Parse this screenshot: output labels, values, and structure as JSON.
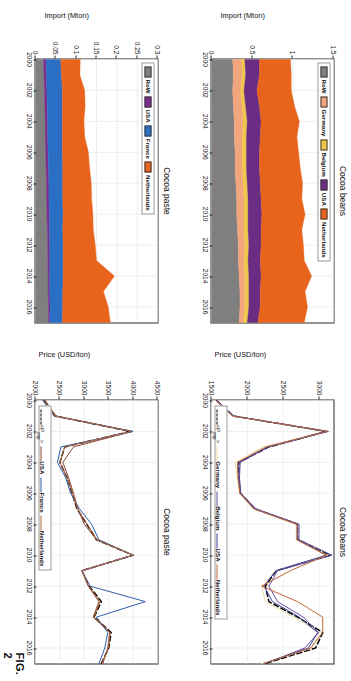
{
  "figure": {
    "label": "FIG. 2"
  },
  "panels": [
    {
      "id": "cocoa-beans-import",
      "title": "Cocoa beans",
      "ylabel": "Import (Mton)",
      "xticks": [
        "2000",
        "2002",
        "2004",
        "2006",
        "2008",
        "2010",
        "2012",
        "2014",
        "2016"
      ],
      "yticks": [
        "0",
        "0.5",
        "1",
        "1.5"
      ],
      "legend": [
        {
          "label": "RoW",
          "color": "#7f7f7f"
        },
        {
          "label": "Germany",
          "color": "#f2a67e"
        },
        {
          "label": "Belgium",
          "color": "#efc74b"
        },
        {
          "label": "USA",
          "color": "#6b2d84"
        },
        {
          "label": "Netherlands",
          "color": "#e8641c"
        }
      ]
    },
    {
      "id": "cocoa-beans-price",
      "title": "Cocoa beans",
      "ylabel": "Price (USD/ton)",
      "xticks": [
        "2000",
        "2002",
        "2004",
        "2006",
        "2008",
        "2010",
        "2012",
        "2014",
        "2016"
      ],
      "yticks": [
        "1500",
        "2000",
        "2500",
        "3000"
      ],
      "legend": [
        {
          "label": "<P_exp>",
          "color": "#000000",
          "style": "dashed"
        },
        {
          "label": "Germany",
          "color": "#edd9a3",
          "style": "solid"
        },
        {
          "label": "Belgium",
          "color": "#6b4fa0",
          "style": "solid"
        },
        {
          "label": "USA",
          "color": "#3b3f9e",
          "style": "solid"
        },
        {
          "label": "Netherlands",
          "color": "#c0663a",
          "style": "solid"
        }
      ]
    },
    {
      "id": "cocoa-paste-import",
      "title": "Cocoa paste",
      "ylabel": "Import (Mton)",
      "xticks": [
        "2000",
        "2002",
        "2004",
        "2006",
        "2008",
        "2010",
        "2012",
        "2014",
        "2016"
      ],
      "yticks": [
        "0",
        "0.05",
        "0.1",
        "0.15",
        "0.2",
        "0.25",
        "0.3"
      ],
      "legend": [
        {
          "label": "RoW",
          "color": "#7f7f7f"
        },
        {
          "label": "USA",
          "color": "#7b2b8e"
        },
        {
          "label": "France",
          "color": "#2b6fc4"
        },
        {
          "label": "Netherlands",
          "color": "#e8641c"
        }
      ]
    },
    {
      "id": "cocoa-paste-price",
      "title": "Cocoa paste",
      "ylabel": "Price (USD/ton)",
      "xticks": [
        "2000",
        "2002",
        "2004",
        "2006",
        "2008",
        "2010",
        "2012",
        "2014",
        "2016"
      ],
      "yticks": [
        "2000",
        "2500",
        "3000",
        "3500",
        "4000",
        "4500"
      ],
      "legend": [
        {
          "label": "<P_exp>",
          "color": "#000000",
          "style": "dashed"
        },
        {
          "label": "USA",
          "color": "#8a4a35",
          "style": "solid"
        },
        {
          "label": "France",
          "color": "#2f5fa8",
          "style": "solid"
        },
        {
          "label": "Netherlands",
          "color": "#b4663f",
          "style": "solid"
        }
      ]
    }
  ],
  "chart_data": [
    {
      "type": "area",
      "id": "cocoa-beans-import",
      "title": "Cocoa beans",
      "xlabel": "",
      "ylabel": "Import (Mton)",
      "xlim": [
        2000,
        2017
      ],
      "ylim": [
        0,
        1.5
      ],
      "grid": true,
      "legend_position": "top",
      "stacked": true,
      "x": [
        2000,
        2001,
        2002,
        2003,
        2004,
        2005,
        2006,
        2007,
        2008,
        2009,
        2010,
        2011,
        2012,
        2013,
        2014,
        2015,
        2016,
        2017
      ],
      "series": [
        {
          "name": "RoW",
          "color": "#7f7f7f",
          "values": [
            0.26,
            0.27,
            0.26,
            0.27,
            0.28,
            0.28,
            0.29,
            0.29,
            0.3,
            0.31,
            0.31,
            0.32,
            0.33,
            0.33,
            0.34,
            0.35,
            0.35,
            0.34
          ]
        },
        {
          "name": "Germany",
          "color": "#f2a67e",
          "values": [
            0.11,
            0.11,
            0.1,
            0.11,
            0.11,
            0.1,
            0.09,
            0.09,
            0.09,
            0.09,
            0.09,
            0.08,
            0.08,
            0.07,
            0.07,
            0.06,
            0.06,
            0.05
          ]
        },
        {
          "name": "Belgium",
          "color": "#efc74b",
          "values": [
            0.04,
            0.04,
            0.04,
            0.04,
            0.05,
            0.05,
            0.05,
            0.05,
            0.05,
            0.05,
            0.05,
            0.05,
            0.05,
            0.05,
            0.05,
            0.05,
            0.05,
            0.05
          ]
        },
        {
          "name": "USA",
          "color": "#6b2d84",
          "values": [
            0.18,
            0.17,
            0.16,
            0.17,
            0.17,
            0.17,
            0.16,
            0.16,
            0.16,
            0.16,
            0.17,
            0.16,
            0.15,
            0.15,
            0.15,
            0.14,
            0.14,
            0.13
          ]
        },
        {
          "name": "Netherlands",
          "color": "#e8641c",
          "values": [
            0.38,
            0.39,
            0.42,
            0.43,
            0.47,
            0.45,
            0.48,
            0.5,
            0.52,
            0.5,
            0.53,
            0.5,
            0.52,
            0.54,
            0.62,
            0.55,
            0.58,
            0.57
          ]
        }
      ],
      "xticks": [
        2000,
        2002,
        2004,
        2006,
        2008,
        2010,
        2012,
        2014,
        2016
      ],
      "yticks": [
        0,
        0.5,
        1,
        1.5
      ]
    },
    {
      "type": "line",
      "id": "cocoa-beans-price",
      "title": "Cocoa beans",
      "xlabel": "",
      "ylabel": "Price (USD/ton)",
      "xlim": [
        2000,
        2017
      ],
      "ylim": [
        1500,
        3200
      ],
      "grid": true,
      "legend_position": "bottom",
      "x": [
        2000,
        2001,
        2002,
        2003,
        2004,
        2005,
        2006,
        2007,
        2008,
        2009,
        2010,
        2011,
        2012,
        2013,
        2014,
        2015,
        2016,
        2017
      ],
      "series": [
        {
          "name": "<P_exp>",
          "color": "#000000",
          "style": "dashed",
          "values": [
            1570,
            1800,
            3100,
            2300,
            1880,
            1880,
            1900,
            2100,
            2700,
            2700,
            3150,
            2400,
            2250,
            2300,
            2700,
            3050,
            2950,
            2250
          ]
        },
        {
          "name": "Germany",
          "color": "#edd9a3",
          "style": "solid",
          "values": [
            1560,
            1790,
            3120,
            2220,
            1830,
            1860,
            1890,
            2080,
            2680,
            2680,
            3120,
            2390,
            2200,
            2250,
            2650,
            3000,
            2900,
            2200
          ]
        },
        {
          "name": "Belgium",
          "color": "#6b4fa0",
          "style": "solid",
          "values": [
            1580,
            1810,
            3130,
            2290,
            1900,
            1890,
            1910,
            2120,
            2720,
            2720,
            3180,
            2420,
            2300,
            2420,
            2780,
            2990,
            2800,
            2250
          ]
        },
        {
          "name": "USA",
          "color": "#3b3f9e",
          "style": "solid",
          "values": [
            1570,
            1800,
            3100,
            2280,
            1880,
            1880,
            1900,
            2100,
            2700,
            2700,
            3100,
            2400,
            2230,
            2350,
            2720,
            2980,
            2850,
            2230
          ]
        },
        {
          "name": "Netherlands",
          "color": "#c0663a",
          "style": "solid",
          "values": [
            1560,
            1795,
            3110,
            2260,
            1860,
            1870,
            1895,
            2090,
            2690,
            2690,
            3100,
            2600,
            2200,
            2700,
            3050,
            3050,
            2880,
            2230
          ]
        }
      ],
      "xticks": [
        2000,
        2002,
        2004,
        2006,
        2008,
        2010,
        2012,
        2014,
        2016
      ],
      "yticks": [
        1500,
        2000,
        2500,
        3000
      ]
    },
    {
      "type": "area",
      "id": "cocoa-paste-import",
      "title": "Cocoa paste",
      "xlabel": "",
      "ylabel": "Import (Mton)",
      "xlim": [
        2000,
        2017
      ],
      "ylim": [
        0,
        0.3
      ],
      "grid": true,
      "legend_position": "top",
      "stacked": true,
      "x": [
        2000,
        2001,
        2002,
        2003,
        2004,
        2005,
        2006,
        2007,
        2008,
        2009,
        2010,
        2011,
        2012,
        2013,
        2014,
        2015,
        2016,
        2017
      ],
      "series": [
        {
          "name": "RoW",
          "color": "#7f7f7f",
          "values": [
            0.02,
            0.021,
            0.022,
            0.023,
            0.024,
            0.024,
            0.025,
            0.026,
            0.027,
            0.027,
            0.028,
            0.029,
            0.03,
            0.03,
            0.031,
            0.031,
            0.032,
            0.032
          ]
        },
        {
          "name": "USA",
          "color": "#7b2b8e",
          "values": [
            0.006,
            0.006,
            0.006,
            0.006,
            0.006,
            0.006,
            0.006,
            0.006,
            0.006,
            0.006,
            0.006,
            0.005,
            0.005,
            0.005,
            0.004,
            0.004,
            0.004,
            0.003
          ]
        },
        {
          "name": "France",
          "color": "#2b6fc4",
          "values": [
            0.036,
            0.037,
            0.038,
            0.037,
            0.036,
            0.036,
            0.035,
            0.035,
            0.034,
            0.034,
            0.034,
            0.033,
            0.033,
            0.033,
            0.033,
            0.032,
            0.031,
            0.031
          ]
        },
        {
          "name": "Netherlands",
          "color": "#e8641c",
          "values": [
            0.048,
            0.045,
            0.055,
            0.056,
            0.053,
            0.055,
            0.064,
            0.066,
            0.07,
            0.071,
            0.073,
            0.075,
            0.079,
            0.082,
            0.126,
            0.1,
            0.112,
            0.118
          ]
        }
      ],
      "xticks": [
        2000,
        2002,
        2004,
        2006,
        2008,
        2010,
        2012,
        2014,
        2016
      ],
      "yticks": [
        0,
        0.05,
        0.1,
        0.15,
        0.2,
        0.25,
        0.3
      ]
    },
    {
      "type": "line",
      "id": "cocoa-paste-price",
      "title": "Cocoa paste",
      "xlabel": "",
      "ylabel": "Price (USD/ton)",
      "xlim": [
        2000,
        2017
      ],
      "ylim": [
        2000,
        4500
      ],
      "grid": true,
      "legend_position": "bottom",
      "x": [
        2000,
        2001,
        2002,
        2003,
        2004,
        2005,
        2006,
        2007,
        2008,
        2009,
        2010,
        2011,
        2012,
        2013,
        2014,
        2015,
        2016,
        2017
      ],
      "series": [
        {
          "name": "<P_exp>",
          "color": "#000000",
          "style": "dashed",
          "values": [
            2180,
            2400,
            3950,
            2600,
            2500,
            2650,
            2750,
            2850,
            3050,
            3250,
            4000,
            2950,
            3100,
            3350,
            3200,
            3550,
            3500,
            3350
          ]
        },
        {
          "name": "USA",
          "color": "#8a4a35",
          "style": "solid",
          "values": [
            2200,
            2420,
            3980,
            2780,
            2560,
            2680,
            2780,
            2870,
            3000,
            3250,
            4000,
            2950,
            3080,
            3300,
            3180,
            3520,
            3480,
            3380
          ]
        },
        {
          "name": "France",
          "color": "#2f5fa8",
          "style": "solid",
          "values": [
            2150,
            2380,
            4000,
            2520,
            2450,
            2620,
            2720,
            2900,
            3150,
            3300,
            4000,
            2950,
            3120,
            4250,
            3250,
            3480,
            3420,
            3300
          ]
        },
        {
          "name": "Netherlands",
          "color": "#b4663f",
          "style": "solid",
          "values": [
            2180,
            2400,
            3960,
            2600,
            2500,
            2650,
            2760,
            2860,
            3060,
            3260,
            4000,
            2950,
            3090,
            3320,
            3200,
            3530,
            3490,
            3360
          ]
        }
      ],
      "xticks": [
        2000,
        2002,
        2004,
        2006,
        2008,
        2010,
        2012,
        2014,
        2016
      ],
      "yticks": [
        2000,
        2500,
        3000,
        3500,
        4000,
        4500
      ]
    }
  ]
}
